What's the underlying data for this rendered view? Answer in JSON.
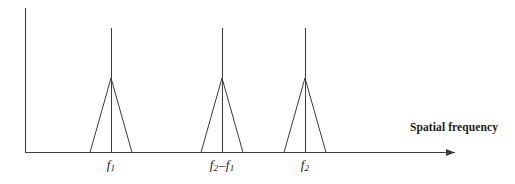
{
  "figure": {
    "background_color": "#ffffff",
    "line_color": "#3c3c3c",
    "text_color": "#1a1a1a",
    "width": 515,
    "height": 184
  },
  "axes": {
    "x_axis": {
      "label": "Spatial frequency",
      "label_x": 410,
      "label_y": 122,
      "start_x": 25,
      "end_x": 455,
      "y": 152,
      "has_arrow": true
    },
    "y_axis": {
      "label": "",
      "x": 25,
      "start_y": 8,
      "end_y": 152,
      "has_arrow": false
    }
  },
  "chart_data": {
    "type": "line",
    "title": "",
    "xlabel": "Spatial frequency",
    "ylabel": "",
    "grid": false,
    "legend": null,
    "baseline_y": 152,
    "xlim": [
      25,
      455
    ],
    "ylim": [
      152,
      8
    ],
    "tick_labels": [
      "f1",
      "f2 - f1",
      "f2"
    ],
    "tick_labels_display": [
      {
        "base": "f",
        "sub": "1",
        "op": "",
        "base2": "",
        "sub2": ""
      },
      {
        "base": "f",
        "sub": "2",
        "op": "–",
        "base2": "f",
        "sub2": "1"
      },
      {
        "base": "f",
        "sub": "2",
        "op": "",
        "base2": "",
        "sub2": ""
      }
    ],
    "tick_label_y": 158,
    "components": [
      {
        "name": "f1",
        "center_x": 111,
        "spike_top_y": 28,
        "triangle_apex_y": 78,
        "triangle_half_width": 21
      },
      {
        "name": "f2-f1",
        "center_x": 222,
        "spike_top_y": 28,
        "triangle_apex_y": 78,
        "triangle_half_width": 21
      },
      {
        "name": "f2",
        "center_x": 305,
        "spike_top_y": 28,
        "triangle_apex_y": 78,
        "triangle_half_width": 21
      }
    ]
  }
}
